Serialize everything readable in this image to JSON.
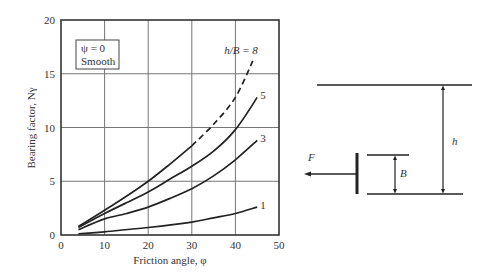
{
  "chart_data": {
    "type": "line",
    "title": "",
    "xlabel": "Friction angle, φ",
    "ylabel": "Bearing factor, Nγ",
    "xlim": [
      0,
      50
    ],
    "ylim": [
      0,
      20
    ],
    "x_ticks": [
      "0",
      "10",
      "20",
      "30",
      "40",
      "50"
    ],
    "y_ticks": [
      "0",
      "5",
      "10",
      "15",
      "20"
    ],
    "grid": true,
    "annotation_box": [
      "ψ = 0",
      "Smooth"
    ],
    "series": [
      {
        "name": "h/B = 8",
        "label": "h/B = 8",
        "style": "solid-then-dashed",
        "dashed_from_x": 30,
        "x": [
          4,
          10,
          15,
          20,
          25,
          30,
          35,
          40,
          44
        ],
        "y": [
          0.8,
          2.3,
          3.6,
          5.0,
          6.6,
          8.3,
          10.3,
          12.8,
          16.2
        ]
      },
      {
        "name": "h/B = 5",
        "label": "5",
        "style": "solid",
        "x": [
          4,
          10,
          15,
          20,
          25,
          30,
          35,
          40,
          45
        ],
        "y": [
          0.7,
          2.0,
          3.0,
          4.0,
          5.2,
          6.4,
          7.8,
          9.8,
          12.8
        ]
      },
      {
        "name": "h/B = 3",
        "label": "3",
        "style": "solid",
        "x": [
          4,
          10,
          15,
          20,
          25,
          30,
          35,
          40,
          45
        ],
        "y": [
          0.5,
          1.5,
          2.0,
          2.6,
          3.4,
          4.3,
          5.5,
          7.0,
          8.8
        ]
      },
      {
        "name": "h/B = 1",
        "label": "1",
        "style": "solid",
        "x": [
          4,
          10,
          20,
          30,
          35,
          40,
          45
        ],
        "y": [
          0.1,
          0.3,
          0.7,
          1.2,
          1.6,
          2.0,
          2.6
        ]
      }
    ]
  },
  "diagram": {
    "force_label": "F",
    "width_label": "B",
    "depth_label": "h"
  }
}
